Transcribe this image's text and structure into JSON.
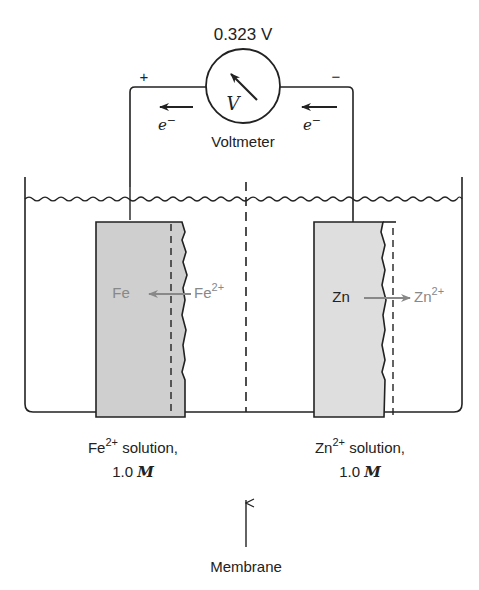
{
  "voltmeter": {
    "reading": "0.323 V",
    "symbol": "V",
    "label": "Voltmeter",
    "plus_terminal": "+",
    "minus_terminal": "−"
  },
  "electron_flow": {
    "left_label": "e",
    "right_label": "e",
    "charge": "−",
    "direction": "right-to-left"
  },
  "left_half_cell": {
    "electrode_label": "Fe",
    "ion_label": "Fe",
    "ion_charge": "2+",
    "reaction_direction": "ion-to-metal",
    "solution_ion": "Fe",
    "solution_charge": "2+",
    "solution_text": " solution,",
    "concentration": "1.0",
    "unit": "M"
  },
  "right_half_cell": {
    "electrode_label": "Zn",
    "ion_label": "Zn",
    "ion_charge": "2+",
    "reaction_direction": "metal-to-ion",
    "solution_ion": "Zn",
    "solution_charge": "2+",
    "solution_text": " solution,",
    "concentration": "1.0",
    "unit": "M"
  },
  "membrane": {
    "label": "Membrane"
  },
  "colors": {
    "line": "#222222",
    "electrode_fill": "#cfcfcf",
    "reaction_text": "#888888"
  }
}
